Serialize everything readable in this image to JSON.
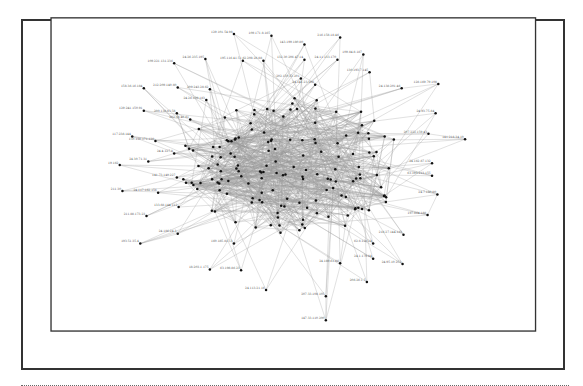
{
  "diagram": {
    "type": "network-graph",
    "frame_color": "#333333",
    "edge_color": "#9a9a9a",
    "node_color": "#111111",
    "label_color": "#555555",
    "nodes": [
      {
        "id": "129.101.54.98",
        "x": 227,
        "y": 38
      },
      {
        "id": "109.171.8.165",
        "x": 269,
        "y": 40
      },
      {
        "id": "216.158.18.46",
        "x": 346,
        "y": 42
      },
      {
        "id": "143.199.180.80",
        "x": 306,
        "y": 50
      },
      {
        "id": "109.221.131.236",
        "x": 160,
        "y": 71
      },
      {
        "id": "24.26.235.195",
        "x": 195,
        "y": 66
      },
      {
        "id": "195.116.41.51",
        "x": 237,
        "y": 68
      },
      {
        "id": "62.208.26.88",
        "x": 260,
        "y": 68
      },
      {
        "id": "132.30.206.47.14",
        "x": 306,
        "y": 67
      },
      {
        "id": "24.11.133.170",
        "x": 343,
        "y": 67
      },
      {
        "id": "109.84.8.187",
        "x": 372,
        "y": 61
      },
      {
        "id": "202.150.53.201",
        "x": 302,
        "y": 88
      },
      {
        "id": "130.193.7.145",
        "x": 379,
        "y": 81
      },
      {
        "id": "24.141.23.196",
        "x": 318,
        "y": 95
      },
      {
        "id": "128.169.79.108",
        "x": 456,
        "y": 94
      },
      {
        "id": "24.138.201.46",
        "x": 415,
        "y": 99
      },
      {
        "id": "158.36.16.184",
        "x": 126,
        "y": 99
      },
      {
        "id": "212.209.140.60",
        "x": 164,
        "y": 98
      },
      {
        "id": "209.243.28.62",
        "x": 200,
        "y": 100
      },
      {
        "id": "24.26.109.183",
        "x": 196,
        "y": 112
      },
      {
        "id": "129.241.150.91",
        "x": 126,
        "y": 124
      },
      {
        "id": "200.138.83.58",
        "x": 163,
        "y": 127
      },
      {
        "id": "202.36.46.61",
        "x": 178,
        "y": 134
      },
      {
        "id": "24.93.75.84",
        "x": 453,
        "y": 127
      },
      {
        "id": "207.222.159.43",
        "x": 445,
        "y": 150
      },
      {
        "id": "141.218.34.10",
        "x": 486,
        "y": 156
      },
      {
        "id": "117.238.144",
        "x": 113,
        "y": 153
      },
      {
        "id": "150.130.171.130",
        "x": 139,
        "y": 158
      },
      {
        "id": "24.4.127.8",
        "x": 160,
        "y": 172
      },
      {
        "id": "24.30.71.31",
        "x": 131,
        "y": 181
      },
      {
        "id": "19.162",
        "x": 99,
        "y": 185
      },
      {
        "id": "24.162.87.132",
        "x": 449,
        "y": 183
      },
      {
        "id": "63.193.213.155",
        "x": 449,
        "y": 197
      },
      {
        "id": "141.73.149.227",
        "x": 163,
        "y": 199
      },
      {
        "id": "211.30",
        "x": 102,
        "y": 214
      },
      {
        "id": "24.117.182.156",
        "x": 142,
        "y": 216
      },
      {
        "id": "24.7.180.80",
        "x": 455,
        "y": 218
      },
      {
        "id": "133.68.144.112",
        "x": 165,
        "y": 232
      },
      {
        "id": "211.88.173.23",
        "x": 129,
        "y": 242
      },
      {
        "id": "197.864.188",
        "x": 444,
        "y": 241
      },
      {
        "id": "24.186.24.3",
        "x": 164,
        "y": 262
      },
      {
        "id": "193.51.35.4",
        "x": 122,
        "y": 273
      },
      {
        "id": "216.27.144.183",
        "x": 417,
        "y": 263
      },
      {
        "id": "160.185.81.53",
        "x": 227,
        "y": 273
      },
      {
        "id": "62.6.128.24",
        "x": 383,
        "y": 273
      },
      {
        "id": "24.1.179.84",
        "x": 383,
        "y": 290
      },
      {
        "id": "24.95.10.252",
        "x": 416,
        "y": 296
      },
      {
        "id": "18.203.1.175",
        "x": 200,
        "y": 302
      },
      {
        "id": "63.198.86.23",
        "x": 235,
        "y": 303
      },
      {
        "id": "24.189.61.86",
        "x": 346,
        "y": 295
      },
      {
        "id": "206.26.1.5",
        "x": 376,
        "y": 316
      },
      {
        "id": "24.113.21.16",
        "x": 263,
        "y": 325
      },
      {
        "id": "207.33.108.105",
        "x": 330,
        "y": 332
      },
      {
        "id": "147.33.110.200",
        "x": 330,
        "y": 359
      }
    ]
  }
}
